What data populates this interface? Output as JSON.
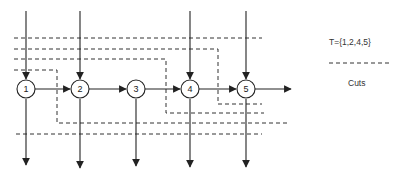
{
  "diagram": {
    "nodes": [
      {
        "id": "1",
        "label": "1",
        "x": 26,
        "y": 89
      },
      {
        "id": "2",
        "label": "2",
        "x": 80,
        "y": 89
      },
      {
        "id": "3",
        "label": "3",
        "x": 136,
        "y": 89
      },
      {
        "id": "4",
        "label": "4",
        "x": 190,
        "y": 89
      },
      {
        "id": "5",
        "label": "5",
        "x": 246,
        "y": 89
      }
    ],
    "edges": [
      {
        "from": "1",
        "to": "2"
      },
      {
        "from": "2",
        "to": "3"
      },
      {
        "from": "3",
        "to": "4"
      },
      {
        "from": "4",
        "to": "5"
      },
      {
        "from": "5",
        "to": "out"
      }
    ],
    "inputs_from_top": [
      "1",
      "2",
      "4",
      "5"
    ],
    "outputs_to_bottom": [
      "1",
      "2",
      "3",
      "4",
      "5"
    ],
    "cuts_count": 5
  },
  "legend": {
    "set_label": "T={1,2,4,5}",
    "cuts_label": "Cuts"
  },
  "colors": {
    "line": "#222222",
    "dash": "#333333",
    "background": "#ffffff"
  }
}
